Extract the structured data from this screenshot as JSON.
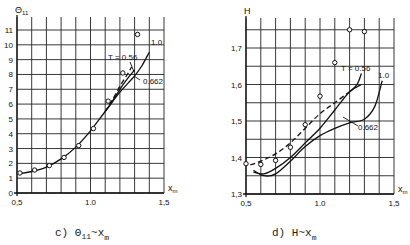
{
  "chart_data": [
    {
      "type": "line",
      "panel": "c",
      "title": "θ11 ~ xm",
      "caption_prefix": "c)",
      "caption_main": "Θ",
      "caption_sub": "11",
      "caption_tail": "~x",
      "caption_tail_sub": "m",
      "ylabel": "Θ11",
      "xlabel": "xm",
      "xlim": [
        0.5,
        1.5
      ],
      "ylim": [
        0,
        11.5
      ],
      "xticks": [
        "0.5",
        "1.0",
        "1.5"
      ],
      "yticks": [
        "0",
        "1",
        "2",
        "3",
        "4",
        "5",
        "6",
        "7",
        "8",
        "9",
        "10",
        "11"
      ],
      "grid": true,
      "annotations": [
        "T = 0.56",
        "0.662",
        "1.0"
      ],
      "points": {
        "x": [
          0.52,
          0.62,
          0.72,
          0.82,
          0.92,
          1.02,
          1.12,
          1.22,
          1.32
        ],
        "y": [
          1.35,
          1.55,
          1.85,
          2.4,
          3.2,
          4.35,
          6.2,
          8.1,
          10.7
        ]
      },
      "series": [
        {
          "name": "T = 1.0",
          "style": "solid",
          "x": [
            0.52,
            0.6,
            0.7,
            0.8,
            0.9,
            1.0,
            1.1,
            1.2,
            1.3,
            1.35,
            1.4
          ],
          "y": [
            1.3,
            1.45,
            1.75,
            2.3,
            3.1,
            4.2,
            5.5,
            6.8,
            7.9,
            8.6,
            9.5
          ]
        },
        {
          "name": "T = 0.662",
          "style": "solid",
          "x": [
            1.1,
            1.15,
            1.2,
            1.25,
            1.3
          ],
          "y": [
            5.5,
            6.2,
            7.0,
            7.7,
            8.3
          ]
        },
        {
          "name": "T = 0.56",
          "style": "dashed",
          "x": [
            1.1,
            1.15,
            1.2,
            1.25,
            1.28
          ],
          "y": [
            5.5,
            6.3,
            7.2,
            8.0,
            8.5
          ]
        }
      ]
    },
    {
      "type": "line",
      "panel": "d",
      "title": "H ~ xm",
      "caption_prefix": "d)",
      "caption_main": "H~x",
      "caption_sub": "m",
      "ylabel": "H",
      "xlabel": "xm",
      "xlim": [
        0.5,
        1.5
      ],
      "ylim": [
        1.3,
        1.78
      ],
      "xticks": [
        "0.5",
        "1.0",
        "1.5"
      ],
      "yticks": [
        "1.3",
        "1.4",
        "1.5",
        "1.6",
        "1.7"
      ],
      "grid": true,
      "annotations": [
        "T = 0.56",
        "0.662",
        "1.0"
      ],
      "points": {
        "x": [
          0.5,
          0.6,
          0.7,
          0.8,
          0.9,
          1.0,
          1.1,
          1.2,
          1.3
        ],
        "y": [
          1.383,
          1.381,
          1.392,
          1.428,
          1.49,
          1.568,
          1.66,
          1.75,
          1.745
        ]
      },
      "series": [
        {
          "name": "T = 0.56",
          "style": "dashed",
          "x": [
            0.53,
            0.6,
            0.7,
            0.8,
            0.9,
            1.0,
            1.1,
            1.2
          ],
          "y": [
            1.38,
            1.39,
            1.41,
            1.44,
            1.48,
            1.52,
            1.55,
            1.58
          ]
        },
        {
          "name": "T = 0.56 (solid)",
          "style": "solid",
          "x": [
            1.2,
            1.25,
            1.28
          ],
          "y": [
            1.58,
            1.6,
            1.63
          ]
        },
        {
          "name": "T = 0.662",
          "style": "solid",
          "x": [
            0.55,
            0.62,
            0.7,
            0.8,
            0.9,
            1.0,
            1.1,
            1.2,
            1.28
          ],
          "y": [
            1.36,
            1.355,
            1.37,
            1.4,
            1.44,
            1.48,
            1.53,
            1.58,
            1.6
          ]
        },
        {
          "name": "T = 1.0",
          "style": "solid",
          "x": [
            0.55,
            0.62,
            0.7,
            0.8,
            0.9,
            1.0,
            1.1,
            1.2,
            1.3,
            1.37,
            1.42
          ],
          "y": [
            1.365,
            1.35,
            1.355,
            1.39,
            1.43,
            1.46,
            1.48,
            1.495,
            1.505,
            1.54,
            1.61
          ]
        }
      ]
    }
  ]
}
